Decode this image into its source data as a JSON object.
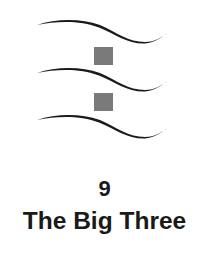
{
  "chapter": {
    "number": "9",
    "title": "The Big Three"
  },
  "ornament": {
    "curve_color": "#1a1a1a",
    "square_color": "#7a7a7a",
    "curves": 3,
    "squares": 2
  }
}
